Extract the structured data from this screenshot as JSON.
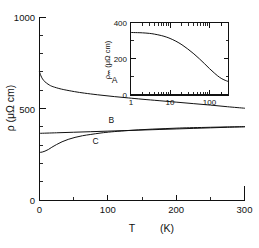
{
  "chart_data": [
    {
      "id": "main",
      "type": "line",
      "title": "",
      "xlabel": "T   (K)",
      "ylabel": "ρ  (μΩ cm)",
      "xlim": [
        0,
        300
      ],
      "ylim": [
        0,
        1000
      ],
      "xticks": [
        0,
        100,
        200,
        300
      ],
      "xticklabels": [
        "0",
        "100",
        "200",
        "300"
      ],
      "yticks": [
        0,
        500,
        1000
      ],
      "yticklabels": [
        "0",
        "500",
        "1000"
      ],
      "xminorticks": [
        25,
        50,
        75,
        125,
        150,
        175,
        225,
        250,
        275
      ],
      "yminorticks": [
        100,
        200,
        300,
        400,
        600,
        700,
        800,
        900
      ],
      "grid": false,
      "legend_position": "inline-curve-labels",
      "xscale": "linear",
      "yscale": "linear",
      "series": [
        {
          "name": "A",
          "label": "A",
          "label_x": 110,
          "label_y": 640,
          "x": [
            0,
            3,
            6,
            10,
            15,
            20,
            30,
            40,
            55,
            70,
            90,
            110,
            130,
            150,
            175,
            200,
            225,
            250,
            275,
            300
          ],
          "values": [
            700,
            672,
            655,
            640,
            628,
            620,
            609,
            601,
            591,
            583,
            574,
            566,
            559,
            552,
            544,
            536,
            528,
            520,
            511,
            503
          ]
        },
        {
          "name": "B",
          "label": "B",
          "label_x": 105,
          "label_y": 425,
          "x": [
            0,
            25,
            50,
            75,
            100,
            125,
            150,
            175,
            200,
            225,
            250,
            275,
            300
          ],
          "values": [
            366,
            369,
            372,
            375,
            378,
            381,
            384,
            387,
            390,
            393,
            396,
            399,
            402
          ]
        },
        {
          "name": "C",
          "label": "C",
          "label_x": 82,
          "label_y": 310,
          "x": [
            0,
            4,
            8,
            13,
            18,
            25,
            33,
            42,
            52,
            63,
            75,
            90,
            105,
            125,
            145,
            165,
            185,
            205,
            225,
            250,
            275,
            300
          ],
          "values": [
            262,
            264,
            269,
            278,
            290,
            305,
            320,
            333,
            344,
            353,
            360,
            368,
            374,
            380,
            385,
            389,
            392,
            395,
            397,
            399,
            401,
            402
          ]
        }
      ]
    },
    {
      "id": "inset",
      "type": "line",
      "title": "",
      "xlabel": "",
      "ylabel": "ρₘ  (μΩ cm)",
      "xscale": "log",
      "yscale": "linear",
      "xlim": [
        1,
        300
      ],
      "ylim": [
        0,
        400
      ],
      "xticks": [
        1,
        10,
        100
      ],
      "xticklabels": [
        "1",
        "10",
        "100"
      ],
      "yticks": [
        0,
        200,
        400
      ],
      "yticklabels": [
        "0",
        "200",
        "400"
      ],
      "grid": false,
      "series": [
        {
          "name": "rho_m",
          "label": "",
          "x": [
            1,
            1.5,
            2,
            3,
            4,
            6,
            8,
            10,
            14,
            20,
            28,
            40,
            55,
            75,
            100,
            135,
            180,
            230,
            300
          ],
          "values": [
            345,
            344,
            343,
            340,
            336,
            328,
            320,
            312,
            297,
            277,
            254,
            227,
            200,
            172,
            145,
            119,
            97,
            84,
            74
          ]
        }
      ]
    }
  ],
  "main_plot": {
    "y_axis_title": "ρ  (μΩ cm)",
    "x_axis_title_symbol": "T",
    "x_axis_title_unit": "(K)",
    "ytick_1000": "1000",
    "ytick_500": "500",
    "ytick_0": "0",
    "xtick_0": "0",
    "xtick_100": "100",
    "xtick_200": "200",
    "xtick_300": "300",
    "curve_a_label": "A",
    "curve_b_label": "B",
    "curve_c_label": "C"
  },
  "inset_plot": {
    "y_axis_title": "ρₘ  (μΩ cm)",
    "ytick_400": "400",
    "ytick_200": "200",
    "ytick_0": "0",
    "xtick_1": "1",
    "xtick_10": "10",
    "xtick_100": "100"
  },
  "colors": {
    "ink": "#111111",
    "paper": "#ffffff"
  }
}
